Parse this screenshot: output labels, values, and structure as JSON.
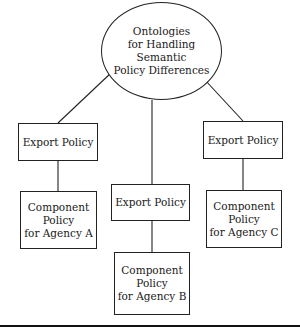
{
  "diagram": {
    "root": {
      "lines": [
        "Ontologies",
        "for Handling Semantic",
        "Policy Differences"
      ]
    },
    "branches": [
      {
        "export": {
          "label": "Export Policy"
        },
        "component": {
          "lines": [
            "Component",
            "Policy",
            "for Agency A"
          ]
        }
      },
      {
        "export": {
          "label": "Export Policy"
        },
        "component": {
          "lines": [
            "Component",
            "Policy",
            "for Agency B"
          ]
        }
      },
      {
        "export": {
          "label": "Export Policy"
        },
        "component": {
          "lines": [
            "Component",
            "Policy",
            "for Agency C"
          ]
        }
      }
    ],
    "colors": {
      "stroke": "#222222",
      "background": "#ffffff"
    }
  }
}
